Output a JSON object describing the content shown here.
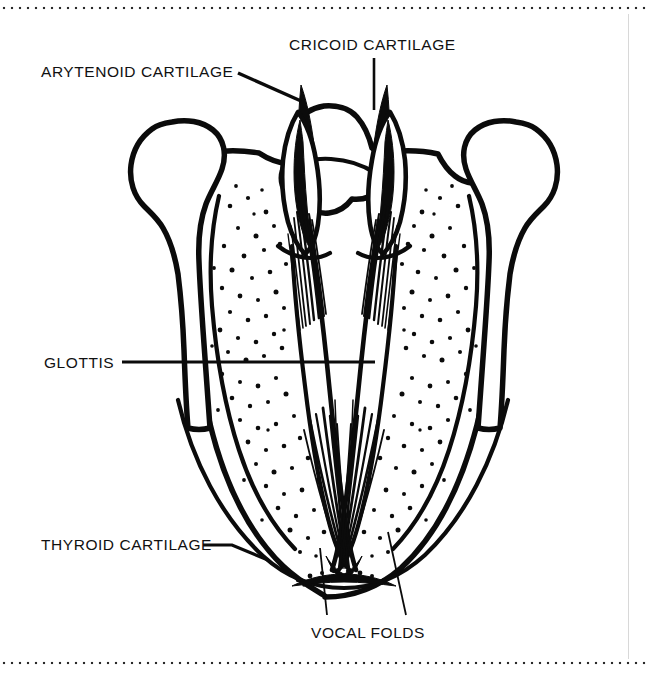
{
  "figure": {
    "view": "superior (from above)",
    "style": "black-and-white line drawing with stippled shading",
    "background_color": "#ffffff",
    "ink_color": "#0b0b0b",
    "border": {
      "top_rule": "dotted",
      "bottom_rule": "dotted",
      "right_rule": "thin vertical line"
    }
  },
  "labels": [
    {
      "id": "arytenoid",
      "text": "ARYTENOID CARTILAGE",
      "x": 41,
      "y": 77,
      "anchor": "start",
      "leader": "diagonal line running down and to the right to the left arytenoid apex"
    },
    {
      "id": "cricoid",
      "text": "CRICOID CARTILAGE",
      "x": 289,
      "y": 50,
      "anchor": "start",
      "leader": "short vertical line descending to the cricoid lamina"
    },
    {
      "id": "glottis",
      "text": "GLOTTIS",
      "x": 44,
      "y": 368,
      "anchor": "start",
      "leader": "long horizontal line running right to the glottic airway opening"
    },
    {
      "id": "thyroid",
      "text": "THYROID CARTILAGE",
      "x": 41,
      "y": 550,
      "anchor": "start",
      "leader": "line running right and down to the thyroid lamina border"
    },
    {
      "id": "vocal-folds",
      "text": "VOCAL FOLDS",
      "x": 311,
      "y": 638,
      "anchor": "start",
      "leader": "two lines rising to the left and right vocal folds at the anterior commissure"
    }
  ],
  "structures": [
    {
      "name": "thyroid-cartilage",
      "description": "large V/U-shaped outer cartilage forming the body of the larynx"
    },
    {
      "name": "superior-horn-left",
      "description": "club-shaped process at the upper left"
    },
    {
      "name": "superior-horn-right",
      "description": "club-shaped process at the upper right"
    },
    {
      "name": "cricoid-cartilage",
      "description": "arched band across the top center, posterior"
    },
    {
      "name": "arytenoid-cartilage-left",
      "description": "dark tapering cartilage left of midline"
    },
    {
      "name": "arytenoid-cartilage-right",
      "description": "dark tapering cartilage right of midline"
    },
    {
      "name": "vocal-fold-left",
      "description": "fibrous band running anteriorly from left arytenoid"
    },
    {
      "name": "vocal-fold-right",
      "description": "fibrous band running anteriorly from right arytenoid"
    },
    {
      "name": "glottis",
      "description": "triangular airway opening between the vocal folds"
    },
    {
      "name": "anterior-commissure",
      "description": "point where both vocal folds meet at the bottom"
    }
  ]
}
